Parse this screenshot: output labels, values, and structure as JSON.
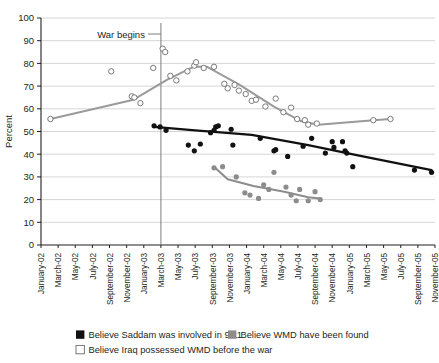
{
  "chart_data": {
    "type": "scatter",
    "title": "",
    "xlabel": "",
    "ylabel": "Percent",
    "ylim": [
      0,
      100
    ],
    "yticks": [
      0,
      10,
      20,
      30,
      40,
      50,
      60,
      70,
      80,
      90,
      100
    ],
    "grid": true,
    "legend_position": "bottom-left",
    "categories": [
      "January-02",
      "March-02",
      "May-02",
      "July-02",
      "September-02",
      "November-02",
      "January-03",
      "March-03",
      "May-03",
      "July-03",
      "September-03",
      "November-03",
      "January-04",
      "March-04",
      "May-04",
      "July-04",
      "September-04",
      "November-04",
      "January-05",
      "March-05",
      "May-05",
      "July-05",
      "September-05",
      "November-05"
    ],
    "annotations": [
      {
        "text": "War begins",
        "x": "March-03",
        "note": "vertical reference line at start of war"
      }
    ],
    "series": [
      {
        "name": "Believe Saddam was involved in 9/11",
        "marker": "filled-square-black",
        "color": "#111111",
        "points": [
          {
            "x": 6.6,
            "y": 52.5
          },
          {
            "x": 6.95,
            "y": 52.0
          },
          {
            "x": 7.3,
            "y": 50.5
          },
          {
            "x": 8.6,
            "y": 44.0
          },
          {
            "x": 8.95,
            "y": 41.5
          },
          {
            "x": 9.3,
            "y": 44.5
          },
          {
            "x": 9.9,
            "y": 49.5
          },
          {
            "x": 10.1,
            "y": 50.5
          },
          {
            "x": 10.2,
            "y": 52.0
          },
          {
            "x": 10.35,
            "y": 52.5
          },
          {
            "x": 11.1,
            "y": 51.0
          },
          {
            "x": 11.2,
            "y": 44.0
          },
          {
            "x": 12.8,
            "y": 47.0
          },
          {
            "x": 13.6,
            "y": 41.5
          },
          {
            "x": 13.7,
            "y": 42.0
          },
          {
            "x": 14.4,
            "y": 39.0
          },
          {
            "x": 15.3,
            "y": 43.5
          },
          {
            "x": 15.8,
            "y": 47.0
          },
          {
            "x": 16.6,
            "y": 40.5
          },
          {
            "x": 17.0,
            "y": 45.5
          },
          {
            "x": 17.1,
            "y": 43.0
          },
          {
            "x": 17.6,
            "y": 45.5
          },
          {
            "x": 17.75,
            "y": 41.5
          },
          {
            "x": 17.85,
            "y": 40.5
          },
          {
            "x": 18.2,
            "y": 34.5
          },
          {
            "x": 21.8,
            "y": 33.0
          },
          {
            "x": 22.8,
            "y": 32.0
          }
        ],
        "trend": [
          {
            "x": 6.6,
            "y": 52.0
          },
          {
            "x": 9.0,
            "y": 50.5
          },
          {
            "x": 12.3,
            "y": 48.5
          },
          {
            "x": 15.6,
            "y": 44.0
          },
          {
            "x": 18.5,
            "y": 39.5
          },
          {
            "x": 22.8,
            "y": 33.0
          }
        ]
      },
      {
        "name": "Believe WMD have been found",
        "marker": "filled-square-gray",
        "color": "#8c8c8c",
        "points": [
          {
            "x": 10.1,
            "y": 34.0
          },
          {
            "x": 10.6,
            "y": 34.5
          },
          {
            "x": 11.4,
            "y": 30.0
          },
          {
            "x": 11.9,
            "y": 23.0
          },
          {
            "x": 12.2,
            "y": 22.0
          },
          {
            "x": 12.7,
            "y": 20.5
          },
          {
            "x": 13.0,
            "y": 26.5
          },
          {
            "x": 13.3,
            "y": 24.5
          },
          {
            "x": 13.6,
            "y": 32.0
          },
          {
            "x": 14.3,
            "y": 25.5
          },
          {
            "x": 14.6,
            "y": 22.0
          },
          {
            "x": 14.9,
            "y": 19.5
          },
          {
            "x": 15.1,
            "y": 24.5
          },
          {
            "x": 15.6,
            "y": 19.5
          },
          {
            "x": 16.0,
            "y": 23.5
          },
          {
            "x": 16.3,
            "y": 20.0
          }
        ],
        "trend": [
          {
            "x": 10.1,
            "y": 34.5
          },
          {
            "x": 10.9,
            "y": 29.0
          },
          {
            "x": 12.4,
            "y": 26.0
          },
          {
            "x": 14.2,
            "y": 23.5
          },
          {
            "x": 15.6,
            "y": 21.0
          },
          {
            "x": 16.3,
            "y": 20.5
          }
        ]
      },
      {
        "name": "Believe Iraq possessed WMD before the war",
        "marker": "open-square",
        "color": "#ffffff",
        "points": [
          {
            "x": 0.55,
            "y": 55.5
          },
          {
            "x": 4.1,
            "y": 76.5
          },
          {
            "x": 5.3,
            "y": 65.5
          },
          {
            "x": 5.45,
            "y": 65.0
          },
          {
            "x": 5.8,
            "y": 62.5
          },
          {
            "x": 6.55,
            "y": 78.0
          },
          {
            "x": 7.1,
            "y": 86.5
          },
          {
            "x": 7.25,
            "y": 85.0
          },
          {
            "x": 7.55,
            "y": 74.5
          },
          {
            "x": 7.9,
            "y": 72.5
          },
          {
            "x": 8.55,
            "y": 76.5
          },
          {
            "x": 8.95,
            "y": 79.0
          },
          {
            "x": 9.05,
            "y": 80.5
          },
          {
            "x": 9.5,
            "y": 78.0
          },
          {
            "x": 10.1,
            "y": 78.5
          },
          {
            "x": 10.7,
            "y": 71.0
          },
          {
            "x": 10.9,
            "y": 69.0
          },
          {
            "x": 11.3,
            "y": 70.5
          },
          {
            "x": 11.55,
            "y": 68.0
          },
          {
            "x": 11.95,
            "y": 66.5
          },
          {
            "x": 12.3,
            "y": 63.5
          },
          {
            "x": 12.55,
            "y": 64.0
          },
          {
            "x": 13.1,
            "y": 61.0
          },
          {
            "x": 13.7,
            "y": 64.5
          },
          {
            "x": 14.15,
            "y": 58.5
          },
          {
            "x": 14.6,
            "y": 60.5
          },
          {
            "x": 14.95,
            "y": 55.5
          },
          {
            "x": 15.4,
            "y": 55.0
          },
          {
            "x": 15.6,
            "y": 53.0
          },
          {
            "x": 16.1,
            "y": 53.5
          },
          {
            "x": 19.4,
            "y": 55.0
          },
          {
            "x": 20.4,
            "y": 55.5
          }
        ],
        "trend": [
          {
            "x": 0.55,
            "y": 55.5
          },
          {
            "x": 5.4,
            "y": 64.0
          },
          {
            "x": 7.4,
            "y": 73.0
          },
          {
            "x": 8.9,
            "y": 78.5
          },
          {
            "x": 9.7,
            "y": 78.5
          },
          {
            "x": 11.6,
            "y": 70.5
          },
          {
            "x": 13.6,
            "y": 61.0
          },
          {
            "x": 15.2,
            "y": 54.5
          },
          {
            "x": 16.2,
            "y": 53.0
          },
          {
            "x": 19.4,
            "y": 55.0
          },
          {
            "x": 20.4,
            "y": 55.5
          }
        ]
      }
    ]
  },
  "legend": {
    "items": [
      {
        "label": "Believe Saddam was involved in 9/11",
        "swatch": "filled-black"
      },
      {
        "label": "Believe WMD have been found",
        "swatch": "filled-gray"
      },
      {
        "label": "Believe Iraq possessed WMD before the war",
        "swatch": "open-white"
      }
    ]
  }
}
